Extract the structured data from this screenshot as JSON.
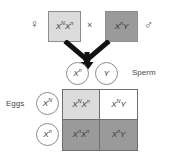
{
  "diagram": {
    "parents": {
      "mother": {
        "symbol": "♀",
        "genotype_base": "X",
        "genotype_parts": [
          {
            "letter": "X",
            "allele": "N"
          },
          {
            "letter": "X",
            "allele": "n"
          }
        ],
        "genotype_text": "X^N X^n",
        "fill": "#dcdcdc"
      },
      "father": {
        "symbol": "♂",
        "genotype_parts": [
          {
            "letter": "X",
            "allele": "n"
          },
          {
            "letter": "Y",
            "allele": ""
          }
        ],
        "genotype_text": "X^n Y",
        "fill": "#9a9a9a"
      },
      "cross_symbol": "×"
    },
    "gametes": {
      "sperm_label": "Sperm",
      "sperm": [
        {
          "letter": "X",
          "allele": "n"
        },
        {
          "letter": "Y",
          "allele": ""
        }
      ],
      "eggs_label": "Eggs",
      "eggs": [
        {
          "letter": "X",
          "allele": "N"
        },
        {
          "letter": "X",
          "allele": "n"
        }
      ]
    },
    "punnett": {
      "cells": [
        {
          "parts": [
            {
              "letter": "X",
              "allele": "N"
            },
            {
              "letter": "X",
              "allele": "n"
            }
          ],
          "text": "X^N X^n",
          "fill": "#dcdcdc",
          "fill_class": "fill-light"
        },
        {
          "parts": [
            {
              "letter": "X",
              "allele": "N"
            },
            {
              "letter": "Y",
              "allele": ""
            }
          ],
          "text": "X^N Y",
          "fill": "#ffffff",
          "fill_class": "fill-white"
        },
        {
          "parts": [
            {
              "letter": "X",
              "allele": "n"
            },
            {
              "letter": "X",
              "allele": "n"
            }
          ],
          "text": "X^n X^n",
          "fill": "#9a9a9a",
          "fill_class": "fill-dark"
        },
        {
          "parts": [
            {
              "letter": "X",
              "allele": "n"
            },
            {
              "letter": "Y",
              "allele": ""
            }
          ],
          "text": "X^n Y",
          "fill": "#9a9a9a",
          "fill_class": "fill-dark"
        }
      ]
    },
    "caption": {
      "clipped_text": ""
    },
    "colors": {
      "light_fill": "#dcdcdc",
      "dark_fill": "#9a9a9a",
      "white_fill": "#ffffff",
      "outline": "#6f6f6f",
      "text": "#3a3a3a",
      "arrow": "#111111"
    }
  }
}
